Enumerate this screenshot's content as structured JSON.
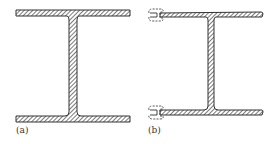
{
  "figure": {
    "panels": [
      {
        "id": "a",
        "label": "(a)",
        "description": "I-beam cross-section, hatched"
      },
      {
        "id": "b",
        "label": "(b)",
        "description": "I-beam cross-section with thin flanges and dashed clip attachments at left flange ends"
      }
    ],
    "colors": {
      "stroke": "#333333",
      "hatch": "#444444",
      "background": "#ffffff"
    }
  }
}
